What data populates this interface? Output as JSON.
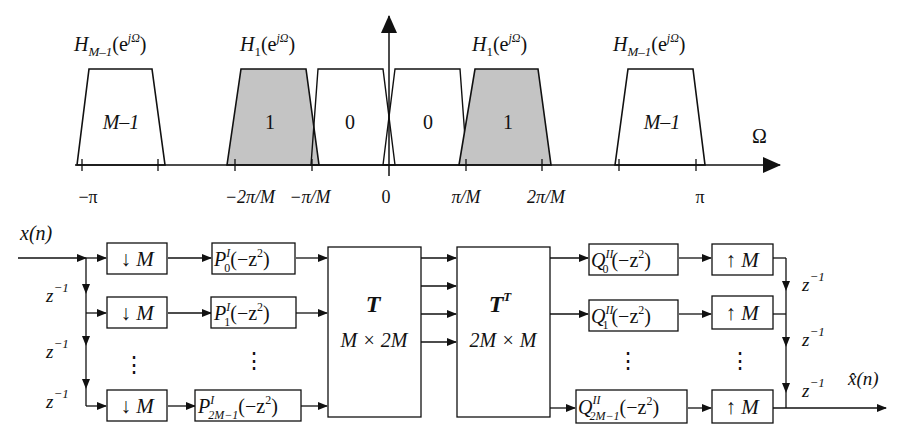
{
  "spectrum": {
    "axis_label": "Ω",
    "filters": [
      {
        "label": "M–1",
        "title_main": "H",
        "title_sub": "M–1",
        "title_arg": "(e",
        "title_sup": "jΩ",
        "title_close": ")",
        "shaded": false
      },
      {
        "label": "1",
        "title_main": "H",
        "title_sub": "1",
        "title_arg": "(e",
        "title_sup": "jΩ",
        "title_close": ")",
        "shaded": true
      },
      {
        "label": "0",
        "shaded": false
      },
      {
        "label": "0",
        "shaded": false
      },
      {
        "label": "1",
        "title_main": "H",
        "title_sub": "1",
        "title_arg": "(e",
        "title_sup": "jΩ",
        "title_close": ")",
        "shaded": true
      },
      {
        "label": "M–1",
        "title_main": "H",
        "title_sub": "M–1",
        "title_arg": "(e",
        "title_sup": "jΩ",
        "title_close": ")",
        "shaded": false
      }
    ],
    "ticks": [
      "−π",
      "−2π/M",
      "−π/M",
      "0",
      "π/M",
      "2π/M",
      "π"
    ],
    "shade_color": "#c4c4c4"
  },
  "block_diagram": {
    "input_label": "x(n)",
    "output_label": "x̂(n)",
    "delay": {
      "base": "z",
      "exp": "−1"
    },
    "downsample_label": "↓ M",
    "upsample_label": "↑ M",
    "analysis_filters": [
      {
        "base": "P",
        "sup": "I",
        "sub": "0",
        "arg": "(−z",
        "arg_sup": "2",
        "close": ")"
      },
      {
        "base": "P",
        "sup": "I",
        "sub": "1",
        "arg": "(−z",
        "arg_sup": "2",
        "close": ")"
      },
      {
        "base": "P",
        "sup": "I",
        "sub": "2M−1",
        "arg": "(−z",
        "arg_sup": "2",
        "close": ")"
      }
    ],
    "synthesis_filters": [
      {
        "base": "Q",
        "sup": "II",
        "sub": "0",
        "arg": "(−z",
        "arg_sup": "2",
        "close": ")"
      },
      {
        "base": "Q",
        "sup": "II",
        "sub": "1",
        "arg": "(−z",
        "arg_sup": "2",
        "close": ")"
      },
      {
        "base": "Q",
        "sup": "II",
        "sub": "2M−1",
        "arg": "(−z",
        "arg_sup": "2",
        "close": ")"
      }
    ],
    "matrix_T": {
      "name": "T",
      "dims": "M × 2M"
    },
    "matrix_TT": {
      "name": "T",
      "sup": "T",
      "dims": "2M × M"
    },
    "ellipsis": "⋮"
  }
}
